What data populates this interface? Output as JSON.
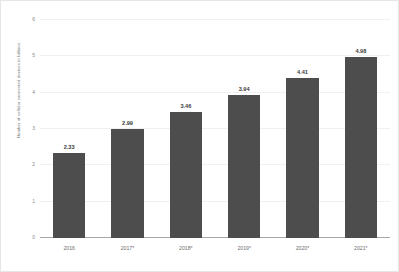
{
  "chart_data": {
    "type": "bar",
    "title": "",
    "subtitle": "",
    "xlabel": "",
    "ylabel": "Number of cellular connected devices in billions",
    "categories": [
      "2016",
      "2017*",
      "2018*",
      "2019*",
      "2020*",
      "2021*"
    ],
    "values": [
      2.33,
      2.99,
      3.46,
      3.94,
      4.41,
      4.98
    ],
    "value_labels": [
      "2.33",
      "2.99",
      "3.46",
      "3.94",
      "4.41",
      "4.98"
    ],
    "series": [
      {
        "name": "Number of cellular connected devices in billions",
        "values": [
          2.33,
          2.99,
          3.46,
          3.94,
          4.41,
          4.98
        ]
      }
    ],
    "ylim": [
      0,
      6
    ],
    "y_ticks": [
      0,
      1,
      2,
      3,
      4,
      5,
      6
    ],
    "y_tick_labels": [
      "0",
      "1",
      "2",
      "3",
      "4",
      "5",
      "6"
    ],
    "grid": true,
    "grid_axis": "y",
    "legend": false,
    "legend_position": "none",
    "bar_color": "#4d4d4d",
    "gridline_color": "#f0f0f0",
    "axis_color": "#a9a9a9",
    "background_color": "#ffffff",
    "annotations": []
  }
}
